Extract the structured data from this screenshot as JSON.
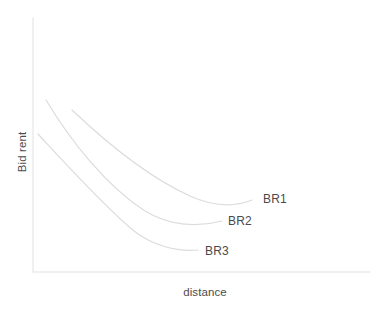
{
  "figure": {
    "background_color": "#ffffff",
    "width": 382,
    "height": 311
  },
  "axes": {
    "x_label": "distance",
    "y_label": "Bid rent",
    "axis_color": "#e8e8e8",
    "label_color": "#4c4c4c",
    "origin_x": 33,
    "origin_y": 272,
    "x_axis_end_x": 370,
    "y_axis_top_y": 18
  },
  "curves": {
    "color": "#dcdcdc",
    "stroke_width": 1.2,
    "br1": {
      "label": "BR1",
      "label_color": "#4a4a4a",
      "path": "M 72,110 C 110,146 150,178 190,196 C 212,206 232,208 252,200"
    },
    "br2": {
      "label": "BR2",
      "label_color": "#4a4a4a",
      "path": "M 46,100 C 70,140 106,186 145,211 C 168,225 196,228 222,221"
    },
    "br3": {
      "label": "BR3",
      "label_color": "#4a4a4a",
      "path": "M 38,134 C 64,162 104,206 134,231 C 152,245 176,252 198,250"
    }
  },
  "chart_data": {
    "type": "line",
    "title": "",
    "subtitle": "",
    "xlabel": "distance",
    "ylabel": "Bid rent",
    "grid": false,
    "legend_position": "inline-end-of-curve",
    "axis_ticks": {
      "x": [],
      "y": []
    },
    "xlim": [
      0,
      1
    ],
    "ylim": [
      0,
      1
    ],
    "note": "Unlabeled qualitative axes; values are normalized 0-1 read off curve geometry.",
    "series": [
      {
        "name": "BR1",
        "annotation": "BR1",
        "x": [
          0.116,
          0.175,
          0.235,
          0.294,
          0.354,
          0.413,
          0.472,
          0.531,
          0.591,
          0.65
        ],
        "y": [
          0.637,
          0.566,
          0.5,
          0.44,
          0.386,
          0.339,
          0.303,
          0.279,
          0.268,
          0.283
        ]
      },
      {
        "name": "BR2",
        "annotation": "BR2",
        "x": [
          0.039,
          0.092,
          0.145,
          0.198,
          0.251,
          0.304,
          0.357,
          0.41,
          0.463,
          0.561
        ],
        "y": [
          0.677,
          0.568,
          0.473,
          0.392,
          0.325,
          0.273,
          0.236,
          0.214,
          0.207,
          0.201
        ]
      },
      {
        "name": "BR3",
        "annotation": "BR3",
        "x": [
          0.015,
          0.058,
          0.102,
          0.145,
          0.189,
          0.232,
          0.276,
          0.319,
          0.375,
          0.49
        ],
        "y": [
          0.566,
          0.466,
          0.377,
          0.299,
          0.233,
          0.179,
          0.137,
          0.108,
          0.086,
          0.081
        ]
      }
    ]
  }
}
